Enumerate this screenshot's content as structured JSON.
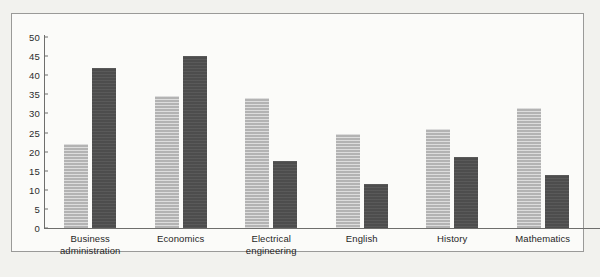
{
  "chart_data": {
    "type": "bar",
    "title": "",
    "subtitle": "",
    "xlabel": "",
    "ylabel": "",
    "ylim": [
      0,
      50
    ],
    "yticks": [
      0,
      5,
      10,
      15,
      20,
      25,
      30,
      35,
      40,
      45,
      50
    ],
    "grid": false,
    "legend": "none",
    "categories": [
      "Business administration",
      "Economics",
      "Electrical engineering",
      "English",
      "History",
      "Mathematics"
    ],
    "category_lines": [
      [
        "Business",
        "administration"
      ],
      [
        "Economics"
      ],
      [
        "Electrical",
        "engineering"
      ],
      [
        "English"
      ],
      [
        "History"
      ],
      [
        "Mathematics"
      ]
    ],
    "series": [
      {
        "name": "series-light",
        "color": "#b3b3b3",
        "values": [
          22,
          34.5,
          34,
          24.5,
          26,
          31.5
        ]
      },
      {
        "name": "series-dark",
        "color": "#4d4d4d",
        "values": [
          42,
          45,
          17.5,
          11.5,
          18.5,
          14
        ]
      }
    ]
  },
  "colors": {
    "page_background": "#f0f0ec",
    "plot_background": "#fbfbf9",
    "frame_border": "#9a9a98",
    "axis": "#6e6e6c",
    "tick_text": "#2c2c2c",
    "bar_light": "#b3b3b3",
    "bar_dark": "#4d4d4d"
  }
}
